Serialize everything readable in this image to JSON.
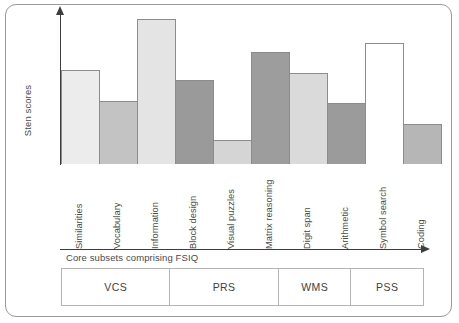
{
  "figure": {
    "ylabel": "Sten scores",
    "xlabel": "Core subsets comprising FSIQ"
  },
  "groups": [
    {
      "label": "VCS",
      "span": 3
    },
    {
      "label": "PRS",
      "span": 3
    },
    {
      "label": "WMS",
      "span": 2
    },
    {
      "label": "PSS",
      "span": 2
    }
  ],
  "chart_data": {
    "type": "bar",
    "title": "",
    "xlabel": "Core subsets comprising FSIQ",
    "ylabel": "Sten scores",
    "ylim": [
      0,
      10
    ],
    "grid": false,
    "legend": null,
    "categories": [
      "Similarities",
      "Vocabulary",
      "Information",
      "Block design",
      "Visual puzzles",
      "Matrix reasoning",
      "Digit span",
      "Arithmetic",
      "Symbol search",
      "Coding"
    ],
    "values": [
      6.3,
      4.2,
      9.7,
      5.6,
      1.6,
      7.5,
      6.1,
      4.1,
      8.1,
      2.7
    ],
    "bar_colors": [
      "#ececec",
      "#c3c3c3",
      "#e4e4e4",
      "#9a9a9a",
      "#d5d5d5",
      "#9d9d9d",
      "#dadada",
      "#9b9b9b",
      "#ffffff",
      "#b6b6b6"
    ],
    "group_assignment": [
      "VCS",
      "VCS",
      "VCS",
      "PRS",
      "PRS",
      "PRS",
      "WMS",
      "WMS",
      "PSS",
      "PSS"
    ]
  }
}
